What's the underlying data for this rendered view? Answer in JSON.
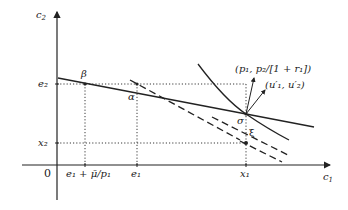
{
  "diagram": {
    "axes": {
      "x_label": "c",
      "x_label_sub": "1",
      "y_label": "c",
      "y_label_sub": "2",
      "origin": "0"
    },
    "x_ticks": [
      {
        "label": "e₁ + μ̄/p₁"
      },
      {
        "label": "e₁"
      },
      {
        "label": "x₁"
      }
    ],
    "y_ticks": [
      {
        "label": "e₂"
      },
      {
        "label": "x₂"
      }
    ],
    "points": {
      "beta": "β",
      "alpha": "α",
      "sigma": "σ",
      "xi": "ξ"
    },
    "vectors": {
      "price": "(p₁, p₂/[1 + r₁])",
      "gradient": "(u′₁, u′₂)"
    },
    "colors": {
      "line": "#222222",
      "background": "#ffffff"
    }
  }
}
